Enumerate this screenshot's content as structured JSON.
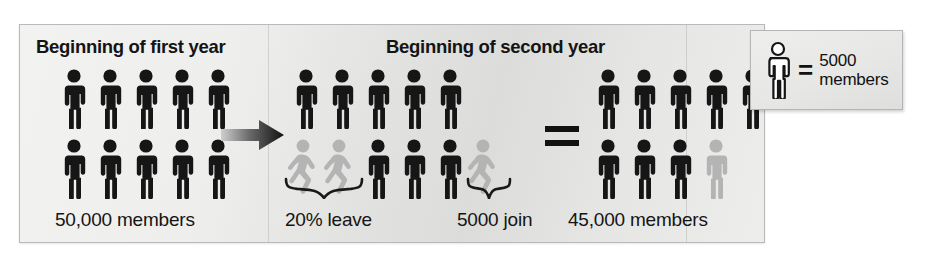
{
  "figure": {
    "type": "pictogram-infographic",
    "unit_icon": "person-figure-icon",
    "panel": {
      "headings": [
        {
          "id": "first-year",
          "label": "Beginning of first year"
        },
        {
          "id": "second-year",
          "label": "Beginning of second year"
        }
      ],
      "operators": [
        {
          "id": "arrow",
          "icon": "right-arrow-icon",
          "symbol": "→"
        },
        {
          "id": "equals",
          "icon": "equals-icon",
          "symbol": "="
        }
      ]
    },
    "legend": {
      "icon": "person-figure-outline-icon",
      "equals": "=",
      "value": "5000",
      "unit": "members"
    },
    "groups": [
      {
        "id": "beginning-first-year",
        "caption": "50,000 members",
        "total_members": 50000,
        "rows": [
          {
            "cells": [
              "black",
              "black",
              "black",
              "black",
              "black"
            ]
          },
          {
            "cells": [
              "black",
              "black",
              "black",
              "black",
              "black"
            ]
          }
        ]
      },
      {
        "id": "beginning-second-year",
        "caption_leave": "20% leave",
        "caption_join": "5000 join",
        "leaving_percent": 20,
        "joining_members": 5000,
        "rows": [
          {
            "cells": [
              "black",
              "black",
              "black",
              "black",
              "black"
            ]
          },
          {
            "cells": [
              "gray-walk",
              "gray-walk",
              "black",
              "black",
              "black",
              "gray-walk"
            ]
          }
        ]
      },
      {
        "id": "result",
        "caption": "45,000 members",
        "total_members": 45000,
        "rows": [
          {
            "cells": [
              "black",
              "black",
              "black",
              "black",
              "black"
            ]
          },
          {
            "cells": [
              "black",
              "black",
              "black",
              "gray-stand"
            ]
          }
        ]
      }
    ],
    "colors": {
      "figure_black": "#161616",
      "figure_gray": "#b4b4b4",
      "panel_bg": "#e9e9e7",
      "panel_border": "#b9b9b9",
      "text": "#141414"
    }
  }
}
